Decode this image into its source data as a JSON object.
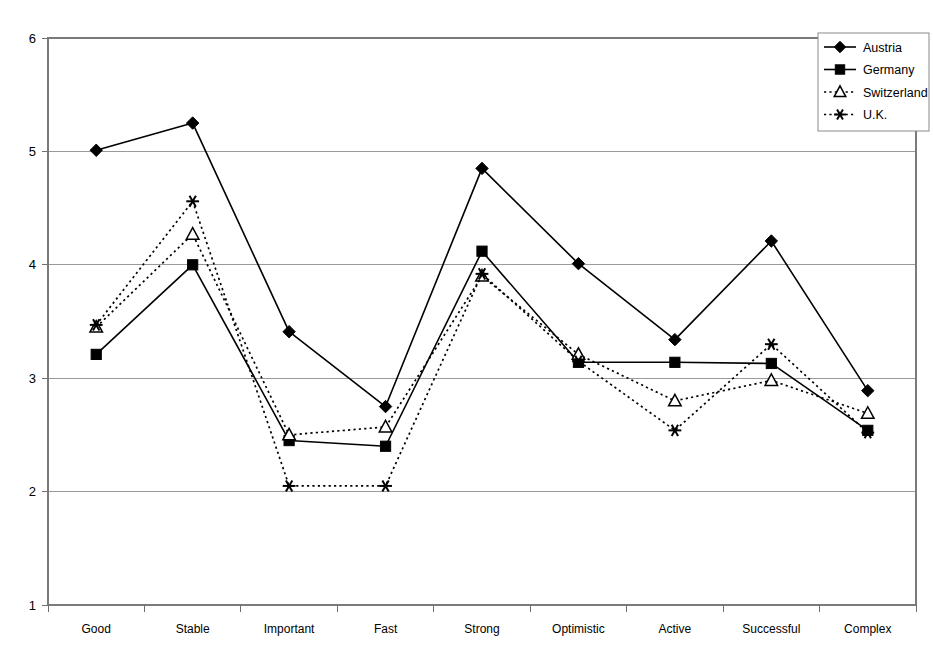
{
  "chart_data": {
    "type": "line",
    "title": "",
    "xlabel": "",
    "ylabel": "",
    "ylim": [
      1,
      6
    ],
    "yticks": [
      1,
      2,
      3,
      4,
      5,
      6
    ],
    "grid": true,
    "legend_position": "top-right",
    "categories": [
      "Good",
      "Stable",
      "Important",
      "Fast",
      "Strong",
      "Optimistic",
      "Active",
      "Successful",
      "Complex"
    ],
    "series": [
      {
        "name": "Austria",
        "marker": "diamond",
        "line_style": "solid",
        "color": "#000000",
        "values": [
          5.01,
          5.25,
          3.41,
          2.75,
          4.85,
          4.01,
          3.34,
          4.21,
          2.89
        ]
      },
      {
        "name": "Germany",
        "marker": "square",
        "line_style": "solid",
        "color": "#000000",
        "values": [
          3.21,
          4.0,
          2.45,
          2.4,
          4.12,
          3.14,
          3.14,
          3.13,
          2.54
        ]
      },
      {
        "name": "Switzerland",
        "marker": "triangle",
        "line_style": "dotted",
        "color": "#000000",
        "values": [
          3.45,
          4.27,
          2.5,
          2.57,
          3.9,
          3.21,
          2.8,
          2.98,
          2.69
        ]
      },
      {
        "name": "U.K.",
        "marker": "star",
        "line_style": "dotted",
        "color": "#000000",
        "values": [
          3.47,
          4.56,
          2.05,
          2.05,
          3.92,
          3.15,
          2.54,
          3.3,
          2.52
        ]
      }
    ]
  },
  "legend": {
    "entries": [
      {
        "label": "Austria"
      },
      {
        "label": "Germany"
      },
      {
        "label": "Switzerland"
      },
      {
        "label": "U.K."
      }
    ]
  },
  "axes": {
    "y_tick_labels": [
      "6",
      "5",
      "4",
      "3",
      "2",
      "1"
    ],
    "x_tick_labels": [
      "Good",
      "Stable",
      "Important",
      "Fast",
      "Strong",
      "Optimistic",
      "Active",
      "Successful",
      "Complex"
    ]
  }
}
